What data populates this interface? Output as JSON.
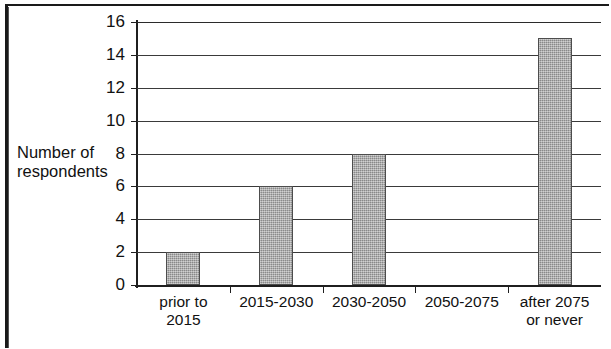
{
  "chart_data": {
    "type": "bar",
    "title": "",
    "xlabel": "",
    "ylabel": "Number of respondents",
    "ylabel_lines": [
      "Number of",
      "respondents"
    ],
    "categories": [
      "prior to 2015",
      "2015-2030",
      "2030-2050",
      "2050-2075",
      "after 2075 or never"
    ],
    "category_lines": [
      [
        "prior to",
        "2015"
      ],
      [
        "2015-2030"
      ],
      [
        "2030-2050"
      ],
      [
        "2050-2075"
      ],
      [
        "after 2075",
        "or never"
      ]
    ],
    "values": [
      2,
      6,
      8,
      0,
      15
    ],
    "ylim": [
      0,
      16
    ],
    "ytick_step": 2,
    "yticks": [
      0,
      2,
      4,
      6,
      8,
      10,
      12,
      14,
      16
    ],
    "ytick_labels": [
      "0",
      "2",
      "4",
      "6",
      "8",
      "10",
      "12",
      "14",
      "16"
    ],
    "grid": true,
    "grid_axis": "y",
    "legend": false,
    "bar_color": "#a6a6a6",
    "bar_border_color": "#4d4d4d",
    "axis_color": "#1f1f1f",
    "grid_color": "#3a3a3a"
  },
  "figure": {
    "border_color": "#1a1a1a",
    "background": "#ffffff"
  }
}
